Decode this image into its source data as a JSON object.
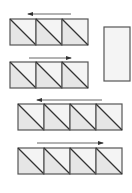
{
  "diagram": {
    "stroke": "#555555",
    "fill_light": "#f4f4f4",
    "fill_shaded": "#e6e6e6",
    "rows": [
      {
        "id": "row-1",
        "x": 10,
        "y": 19,
        "cells": 3,
        "size": 26,
        "arrow": {
          "direction": "left",
          "x1": 28,
          "x2": 71,
          "y": 14
        }
      },
      {
        "id": "row-2",
        "x": 10,
        "y": 62,
        "cells": 3,
        "size": 26,
        "arrow": {
          "direction": "right",
          "x1": 29,
          "x2": 71,
          "y": 58
        }
      },
      {
        "id": "row-3",
        "x": 18,
        "y": 104,
        "cells": 4,
        "size": 26,
        "arrow": {
          "direction": "left",
          "x1": 37,
          "x2": 102,
          "y": 100
        }
      },
      {
        "id": "row-4",
        "x": 18,
        "y": 148,
        "cells": 4,
        "size": 26,
        "arrow": {
          "direction": "right",
          "x1": 37,
          "x2": 103,
          "y": 143
        }
      }
    ],
    "rectangle": {
      "x": 104,
      "y": 27,
      "w": 26,
      "h": 54
    }
  }
}
